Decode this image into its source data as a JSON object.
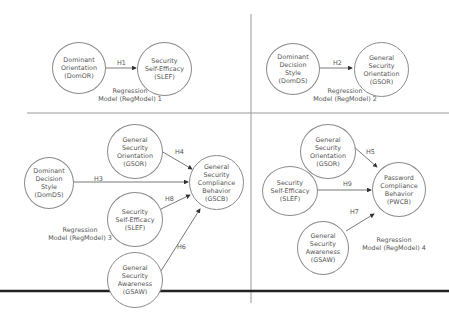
{
  "panels": [
    {
      "id": "model1",
      "caption": "Regression\nModel (RegModel) 1",
      "nodes": [
        {
          "id": "DomOR",
          "label": "Dominant\nOrientation\n(DomOR)"
        },
        {
          "id": "SLEF",
          "label": "Security\nSelf-Efficacy\n(SLEF)"
        }
      ],
      "edges": [
        {
          "from": "DomOR",
          "to": "SLEF",
          "label": "H1"
        }
      ]
    },
    {
      "id": "model2",
      "caption": "Regression\nModel (RegModel) 2",
      "nodes": [
        {
          "id": "DomDS",
          "label": "Dominant\nDecision\nStyle\n(DomDS)"
        },
        {
          "id": "GSOR",
          "label": "General\nSecurity\nOrientation\n(GSOR)"
        }
      ],
      "edges": [
        {
          "from": "DomDS",
          "to": "GSOR",
          "label": "H2"
        }
      ]
    },
    {
      "id": "model3",
      "caption": "Regression\nModel (RegModel) 3",
      "nodes": [
        {
          "id": "DomDS",
          "label": "Dominant\nDecision\nStyle\n(DomDS)"
        },
        {
          "id": "GSOR",
          "label": "General\nSecurity\nOrientation\n(GSOR)"
        },
        {
          "id": "SLEF",
          "label": "Security\nSelf-Efficacy\n(SLEF)"
        },
        {
          "id": "GSAW",
          "label": "General\nSecurity\nAwareness\n(GSAW)"
        },
        {
          "id": "GSCB",
          "label": "General\nSecurity\nCompliance\nBehavior\n(GSCB)"
        }
      ],
      "edges": [
        {
          "from": "GSOR",
          "to": "GSCB",
          "label": "H4"
        },
        {
          "from": "DomDS",
          "to": "GSCB",
          "label": "H3"
        },
        {
          "from": "SLEF",
          "to": "GSCB",
          "label": "H8"
        },
        {
          "from": "GSAW",
          "to": "GSCB",
          "label": "H6"
        }
      ]
    },
    {
      "id": "model4",
      "caption": "Regression\nModel (RegModel) 4",
      "nodes": [
        {
          "id": "GSOR",
          "label": "General\nSecurity\nOrientation\n(GSOR)"
        },
        {
          "id": "SLEF",
          "label": "Security\nSelf-Efficacy\n(SLEF)"
        },
        {
          "id": "GSAW",
          "label": "General\nSecurity\nAwareness\n(GSAW)"
        },
        {
          "id": "PWCB",
          "label": "Password\nCompliance\nBehavior\n(PWCB)"
        }
      ],
      "edges": [
        {
          "from": "GSOR",
          "to": "PWCB",
          "label": "H5"
        },
        {
          "from": "SLEF",
          "to": "PWCB",
          "label": "H9"
        },
        {
          "from": "GSAW",
          "to": "PWCB",
          "label": "H7"
        }
      ]
    }
  ],
  "colors": {
    "line": "#8a8a8a",
    "text": "#555555",
    "bottom_rule": "#222222"
  }
}
